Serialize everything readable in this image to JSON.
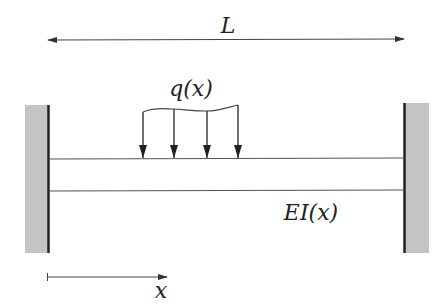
{
  "diagram": {
    "labels": {
      "length": "L",
      "load": "q(x)",
      "stiffness": "EI(x)",
      "axis": "x"
    },
    "colors": {
      "line": "#333333",
      "wall_fill": "#c4c4c4",
      "wall_edge": "#222222",
      "text": "#222222"
    },
    "supports": [
      {
        "side": "left",
        "type": "fixed-wall"
      },
      {
        "side": "right",
        "type": "fixed-wall"
      }
    ],
    "load_arrows": 4
  }
}
